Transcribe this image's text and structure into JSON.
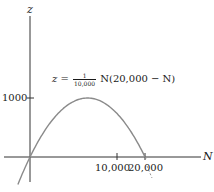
{
  "chart_data": {
    "type": "line",
    "title": "",
    "equation": {
      "lhs": "z",
      "equals": "=",
      "frac_num": "1",
      "frac_den": "10,000",
      "rhs": "N(20,000 − N)"
    },
    "xlabel": "N",
    "ylabel": "z",
    "x_ticks": [
      {
        "value": 10000,
        "label": "10,000"
      },
      {
        "value": 20000,
        "label": "20,000"
      }
    ],
    "y_ticks": [
      {
        "value": 1000,
        "label": "1000"
      }
    ],
    "xlim": [
      -2600,
      26500
    ],
    "ylim": [
      -700,
      2700
    ],
    "grid": false,
    "legend": null,
    "series": [
      {
        "name": "z = N(20000 - N)/10000",
        "x": [
          -2000,
          0,
          2500,
          5000,
          7500,
          10000,
          12500,
          15000,
          17500,
          20000,
          21000
        ],
        "values": [
          -4400,
          0,
          4375,
          7500,
          9375,
          10000,
          9375,
          7500,
          4375,
          0,
          -2100
        ]
      }
    ],
    "annotations": [
      {
        "text": "z = (1/10,000) N(20,000 − N)",
        "position": "above curve, upper middle"
      }
    ]
  },
  "labels": {
    "z_axis": "z",
    "n_axis": "N",
    "tick_1000": "1000",
    "tick_10000": "10,000",
    "tick_20000": "20,000"
  }
}
